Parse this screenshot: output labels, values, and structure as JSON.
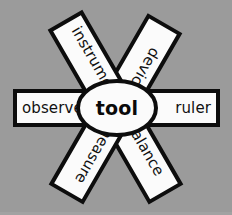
{
  "diagram": {
    "type": "word-web",
    "background_color": "#9b9b9b",
    "shape_fill_color": "#fbfbfb",
    "shape_stroke_color": "#0d0d0d",
    "text_color": "#111111",
    "center": {
      "label": "tool",
      "shape": "ellipse"
    },
    "spokes": [
      {
        "id": "upper-left",
        "label": "device",
        "angle_deg": -60,
        "position": "upper-left"
      },
      {
        "id": "upper-right",
        "label": "instrument",
        "angle_deg": -120,
        "position": "upper-right"
      },
      {
        "id": "left",
        "label": "observe",
        "angle_deg": 0,
        "position": "left"
      },
      {
        "id": "right",
        "label": "ruler",
        "angle_deg": 0,
        "position": "right"
      },
      {
        "id": "lower-left",
        "label": "balance",
        "angle_deg": 60,
        "position": "lower-left"
      },
      {
        "id": "lower-right",
        "label": "measure",
        "angle_deg": 120,
        "position": "lower-right"
      }
    ]
  }
}
